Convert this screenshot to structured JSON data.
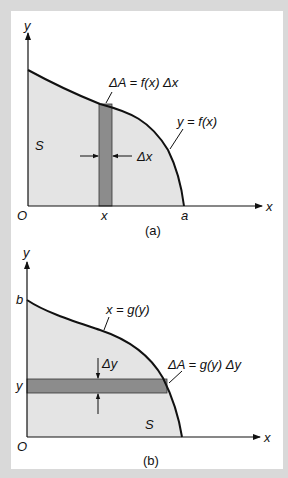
{
  "figure_a": {
    "y_axis_label": "y",
    "x_axis_label": "x",
    "origin_label": "O",
    "region_label": "S",
    "strip_x_label": "x",
    "endpoint_label": "a",
    "curve_label": "y = f(x)",
    "area_element_label": "ΔA = f(x) Δx",
    "width_label": "Δx",
    "caption": "(a)"
  },
  "figure_b": {
    "y_axis_label": "y",
    "x_axis_label": "x",
    "origin_label": "O",
    "region_label": "S",
    "strip_y_label": "y",
    "endpoint_label": "b",
    "curve_label": "x = g(y)",
    "area_element_label": "ΔA = g(y) Δy",
    "height_label": "Δy",
    "caption": "(b)"
  },
  "colors": {
    "background": "#d9d9d9",
    "panel": "#ffffff",
    "region_fill": "#e4e4e4",
    "strip_fill": "#8c8c8c",
    "line": "#111111"
  }
}
